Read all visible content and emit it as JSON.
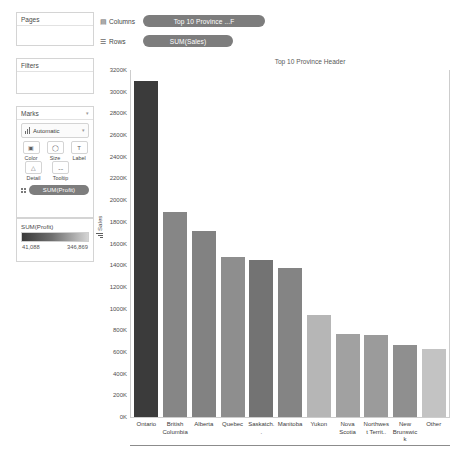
{
  "left_panel": {
    "pages": {
      "title": "Pages"
    },
    "filters": {
      "title": "Filters"
    },
    "marks": {
      "title": "Marks",
      "mark_type": "Automatic",
      "buttons": [
        {
          "label": "Color",
          "icon": "color-icon"
        },
        {
          "label": "Size",
          "icon": "size-icon"
        },
        {
          "label": "Label",
          "icon": "label-icon"
        },
        {
          "label": "Detail",
          "icon": "detail-icon"
        },
        {
          "label": "Tooltip",
          "icon": "tooltip-icon"
        }
      ],
      "encoding_pill": "SUM(Profit)"
    },
    "legend": {
      "title": "SUM(Profit)",
      "min": "41,088",
      "max": "346,869",
      "ramp_dark": "#3a3a3a",
      "ramp_light": "#d4d4d4"
    }
  },
  "shelves": {
    "columns": {
      "label": "Columns",
      "pill": "Top 10 Province ...F"
    },
    "rows": {
      "label": "Rows",
      "pill": "SUM(Sales)"
    }
  },
  "chart_data": {
    "type": "bar",
    "title": "Top 10 Province Header",
    "xlabel": "",
    "ylabel": "Sales",
    "ylim": [
      0,
      3200000
    ],
    "ytick_labels": [
      "3200K",
      "3000K",
      "2800K",
      "2600K",
      "2400K",
      "2200K",
      "2000K",
      "1800K",
      "1600K",
      "1400K",
      "1200K",
      "1000K",
      "800K",
      "600K",
      "400K",
      "200K",
      "0K"
    ],
    "ytick_values": [
      3200000,
      3000000,
      2800000,
      2600000,
      2400000,
      2200000,
      2000000,
      1800000,
      1600000,
      1400000,
      1200000,
      1000000,
      800000,
      600000,
      400000,
      200000,
      0
    ],
    "grid": false,
    "legend_position": "left-panel",
    "color_encoding": "SUM(Profit)",
    "categories": [
      "Ontario",
      "British Columbia",
      "Alberta",
      "Quebec",
      "Saskatch..",
      "Manitoba",
      "Yukon",
      "Nova Scotia",
      "Northwest Territ..",
      "New Brunswick",
      "Other"
    ],
    "values": [
      3100000,
      1890000,
      1720000,
      1480000,
      1450000,
      1370000,
      940000,
      770000,
      760000,
      660000,
      625000
    ],
    "bar_colors": [
      "#3b3b3b",
      "#868686",
      "#828282",
      "#8e8e8e",
      "#737373",
      "#848484",
      "#b6b6b6",
      "#a1a1a1",
      "#9b9b9b",
      "#8f8f8f",
      "#c3c3c3"
    ]
  }
}
